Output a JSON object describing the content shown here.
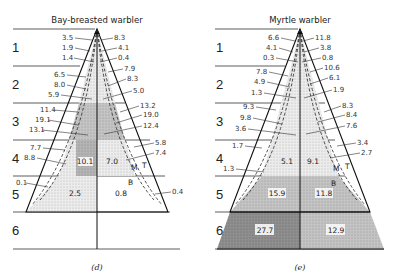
{
  "panels": [
    {
      "title": "Bay-breasted warbler",
      "caption": "(d)",
      "zones": [
        "1",
        "2",
        "3",
        "4",
        "5",
        "6"
      ],
      "left_labels": [
        "3.5",
        "1.9",
        "1.4",
        "6.5",
        "8.0",
        "5.9",
        "11.4",
        "19.1",
        "13.1",
        "7.7",
        "8.8",
        "0.1"
      ],
      "right_labels": [
        "8.3",
        "4.1",
        "0.4",
        "7.9",
        "8.3",
        "5.0",
        "13.2",
        "19.0",
        "12.4",
        "5.8",
        "7.4",
        "0.4"
      ],
      "cells": {
        "z4_left": "10.1",
        "z4_right": "7.0",
        "z5_left": "2.5",
        "z5_right": "0.8"
      },
      "letters": {
        "M": "M",
        "T": "T",
        "B": "B"
      }
    },
    {
      "title": "Myrtle warbler",
      "caption": "(e)",
      "zones": [
        "1",
        "2",
        "3",
        "4",
        "5",
        "6"
      ],
      "left_labels": [
        "6.6",
        "4.1",
        "0.3",
        "7.8",
        "4.9",
        "1.3",
        "9.3",
        "9.8",
        "3.6",
        "1.7",
        "1.3"
      ],
      "right_labels": [
        "11.8",
        "3.8",
        "0.8",
        "10.6",
        "6.1",
        "1.9",
        "8.3",
        "8.4",
        "7.6",
        "3.4",
        "2.7"
      ],
      "cells": {
        "z4_left": "5.1",
        "z4_right": "9.1",
        "z5_left": "15.9",
        "z5_right": "11.8",
        "z6_left": "27.7",
        "z6_right": "12.9"
      },
      "letters": {
        "M": "M",
        "T": "T",
        "B": "B"
      }
    }
  ]
}
